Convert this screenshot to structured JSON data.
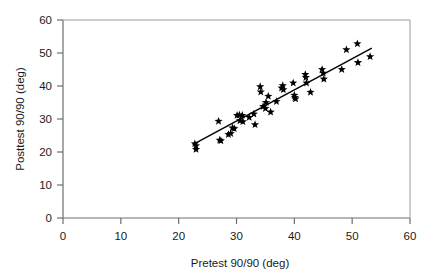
{
  "chart_data": {
    "type": "scatter",
    "title": "",
    "xlabel": "Pretest 90/90 (deg)",
    "ylabel": "Posttest 90/90 (deg)",
    "xlim": [
      0,
      60
    ],
    "ylim": [
      0,
      60
    ],
    "xticks": [
      0,
      10,
      20,
      30,
      40,
      50,
      60
    ],
    "yticks": [
      0,
      10,
      20,
      30,
      40,
      50,
      60
    ],
    "xtick_labels": [
      "0",
      "10",
      "20",
      "30",
      "40",
      "50",
      "60"
    ],
    "ytick_labels": [
      "0",
      "10",
      "20",
      "30",
      "40",
      "50",
      "60"
    ],
    "grid": false,
    "legend": null,
    "marker": "star",
    "marker_color": "#000000",
    "axis_color": "#7a7a7a",
    "points": [
      [
        22.8,
        22.5
      ],
      [
        23.0,
        21.9
      ],
      [
        23.0,
        20.8
      ],
      [
        26.9,
        29.3
      ],
      [
        27.1,
        23.6
      ],
      [
        27.3,
        23.4
      ],
      [
        28.6,
        25.3
      ],
      [
        29.0,
        25.6
      ],
      [
        29.3,
        27.3
      ],
      [
        29.6,
        27.1
      ],
      [
        30.1,
        31.1
      ],
      [
        30.5,
        31.2
      ],
      [
        30.6,
        29.5
      ],
      [
        31.0,
        31.1
      ],
      [
        31.1,
        29.2
      ],
      [
        32.2,
        30.5
      ],
      [
        33.0,
        31.5
      ],
      [
        33.2,
        28.3
      ],
      [
        34.1,
        39.8
      ],
      [
        34.2,
        38.2
      ],
      [
        34.6,
        33.8
      ],
      [
        35.0,
        33.2
      ],
      [
        35.1,
        35.0
      ],
      [
        35.5,
        36.9
      ],
      [
        35.9,
        32.1
      ],
      [
        36.9,
        35.3
      ],
      [
        37.8,
        39.4
      ],
      [
        38.0,
        40.1
      ],
      [
        38.1,
        38.9
      ],
      [
        39.8,
        40.9
      ],
      [
        40.0,
        37.2
      ],
      [
        40.1,
        36.5
      ],
      [
        40.2,
        36.1
      ],
      [
        41.9,
        43.5
      ],
      [
        42.0,
        42.6
      ],
      [
        42.1,
        40.9
      ],
      [
        42.8,
        38.1
      ],
      [
        44.8,
        45.0
      ],
      [
        45.0,
        43.9
      ],
      [
        45.1,
        42.1
      ],
      [
        48.2,
        45.0
      ],
      [
        49.0,
        51.0
      ],
      [
        50.9,
        52.8
      ],
      [
        51.0,
        47.1
      ],
      [
        53.1,
        48.9
      ]
    ],
    "trendline": {
      "x_start": 22.6,
      "y_start": 22.4,
      "x_end": 53.4,
      "y_end": 51.5,
      "color": "#000000"
    }
  }
}
